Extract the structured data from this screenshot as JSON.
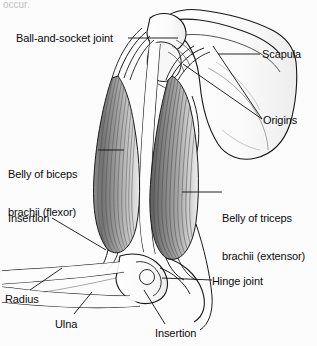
{
  "figure": {
    "page_text_fragment": "occur.",
    "background_color": "#fcfcfc",
    "ink_color": "#111111",
    "muscle_fill_dark": "#6f6f6f",
    "muscle_fill_light": "#d8d8d8",
    "bone_fill": "#fbfbfb"
  },
  "labels": {
    "ball_and_socket_joint": "Ball-and-socket joint",
    "scapula": "Scapula",
    "origins": "Origins",
    "belly_of_biceps_line1": "Belly of biceps",
    "belly_of_biceps_line2": "brachii (flexor)",
    "belly_of_triceps_line1": "Belly of triceps",
    "belly_of_triceps_line2": "brachii (extensor)",
    "insertion_upper": "Insertion",
    "hinge_joint": "Hinge joint",
    "radius": "Radius",
    "ulna": "Ulna",
    "insertion_lower": "Insertion"
  },
  "structures": [
    {
      "name": "scapula",
      "kind": "bone"
    },
    {
      "name": "humerus",
      "kind": "bone"
    },
    {
      "name": "radius",
      "kind": "bone"
    },
    {
      "name": "ulna",
      "kind": "bone"
    },
    {
      "name": "biceps-brachii",
      "kind": "muscle",
      "role": "flexor"
    },
    {
      "name": "triceps-brachii",
      "kind": "muscle",
      "role": "extensor"
    },
    {
      "name": "shoulder-joint",
      "kind": "joint",
      "joint_type": "ball-and-socket"
    },
    {
      "name": "elbow-joint",
      "kind": "joint",
      "joint_type": "hinge"
    }
  ]
}
